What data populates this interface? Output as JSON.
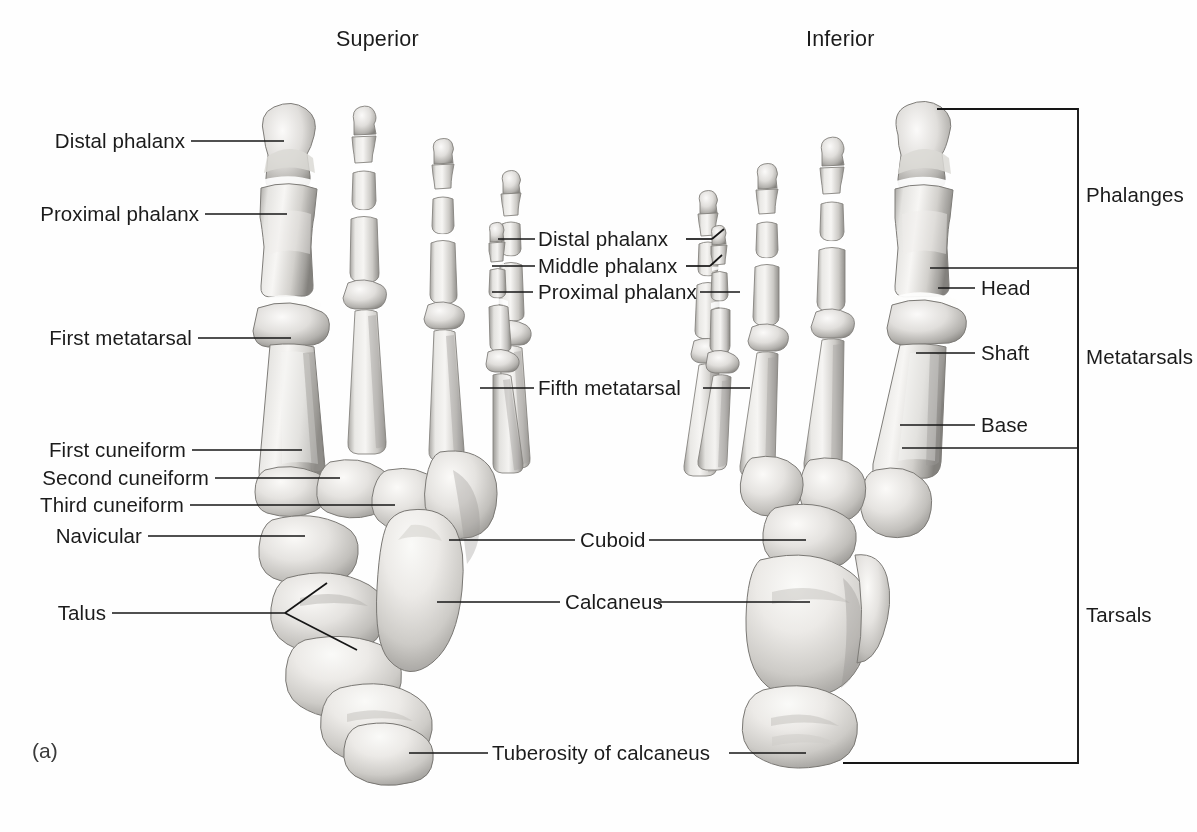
{
  "figure": {
    "panel_letter": "(a)",
    "view_headings": [
      {
        "id": "superior",
        "text": "Superior"
      },
      {
        "id": "inferior",
        "text": "Inferior"
      }
    ]
  },
  "labels_left": [
    {
      "id": "distal-phalanx",
      "text": "Distal phalanx"
    },
    {
      "id": "proximal-phalanx",
      "text": "Proximal phalanx"
    },
    {
      "id": "first-metatarsal",
      "text": "First metatarsal"
    },
    {
      "id": "first-cuneiform",
      "text": "First cuneiform"
    },
    {
      "id": "second-cuneiform",
      "text": "Second cuneiform"
    },
    {
      "id": "third-cuneiform",
      "text": "Third cuneiform"
    },
    {
      "id": "navicular",
      "text": "Navicular"
    },
    {
      "id": "talus",
      "text": "Talus"
    }
  ],
  "labels_center": [
    {
      "id": "distal-phalanx-5",
      "text": "Distal phalanx"
    },
    {
      "id": "middle-phalanx-5",
      "text": "Middle phalanx"
    },
    {
      "id": "proximal-phalanx-5",
      "text": "Proximal phalanx"
    },
    {
      "id": "fifth-metatarsal",
      "text": "Fifth metatarsal"
    },
    {
      "id": "cuboid",
      "text": "Cuboid"
    },
    {
      "id": "calcaneus",
      "text": "Calcaneus"
    },
    {
      "id": "tuberosity-of-calcaneus",
      "text": "Tuberosity of calcaneus"
    }
  ],
  "labels_right": [
    {
      "id": "head",
      "text": "Head"
    },
    {
      "id": "shaft",
      "text": "Shaft"
    },
    {
      "id": "base",
      "text": "Base"
    }
  ],
  "bracket_groups": [
    {
      "id": "phalanges",
      "text": "Phalanges"
    },
    {
      "id": "metatarsals",
      "text": "Metatarsals"
    },
    {
      "id": "tarsals",
      "text": "Tarsals"
    }
  ],
  "colors": {
    "background": "#fefefe",
    "ink": "#161616",
    "bone_light": "#f2f1ef",
    "bone_mid": "#cfcdc9",
    "bone_shadow": "#8e8c88",
    "bone_dark": "#6a6865"
  }
}
